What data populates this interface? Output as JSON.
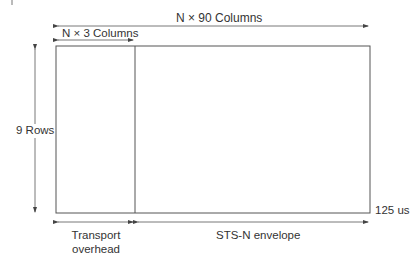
{
  "diagram": {
    "top_span_label": "N × 90 Columns",
    "overhead_span_label": "N × 3 Columns",
    "rows_label": "9 Rows",
    "time_label": "125 us",
    "overhead_label_line1": "Transport",
    "overhead_label_line2": "overhead",
    "envelope_label": "STS-N envelope",
    "colors": {
      "line": "#555555",
      "text": "#333333"
    }
  }
}
